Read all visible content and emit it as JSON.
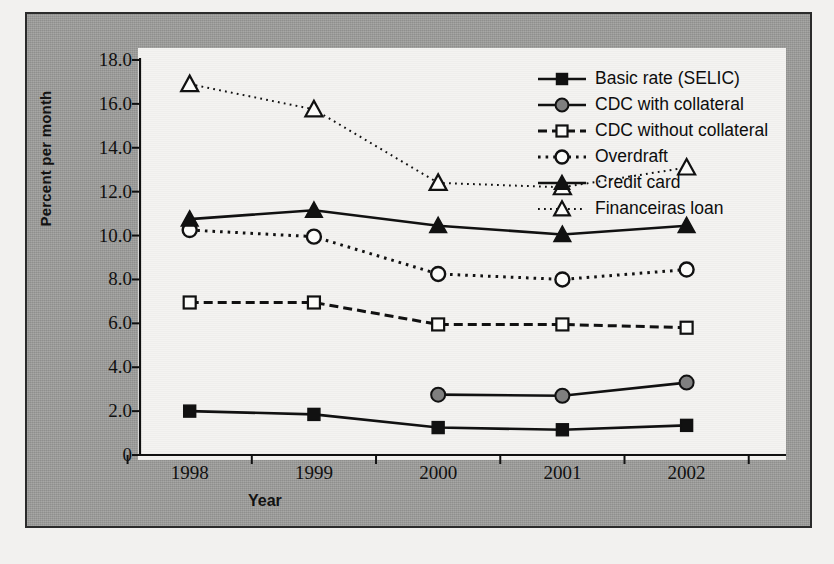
{
  "chart_data": {
    "type": "line",
    "title": "",
    "xlabel": "Year",
    "ylabel": "Percent per month",
    "categories": [
      "1998",
      "1999",
      "2000",
      "2001",
      "2002"
    ],
    "x": [
      1998,
      1999,
      2000,
      2001,
      2002
    ],
    "ylim": [
      0,
      18
    ],
    "xlim": [
      1997.6,
      2002.8
    ],
    "yticks": [
      "0",
      "2.0",
      "4.0",
      "6.0",
      "8.0",
      "10.0",
      "12.0",
      "14.0",
      "16.0",
      "18.0"
    ],
    "ytick_values": [
      0,
      2,
      4,
      6,
      8,
      10,
      12,
      14,
      16,
      18
    ],
    "grid": false,
    "legend_position": "upper right",
    "series": [
      {
        "name": "Basic rate (SELIC)",
        "marker": "filled-square",
        "line": "solid",
        "color": "#111111",
        "values": [
          2.0,
          1.85,
          1.25,
          1.15,
          1.35
        ]
      },
      {
        "name": "CDC with collateral",
        "marker": "filled-circle",
        "line": "solid",
        "color": "#111111",
        "marker_fill": "#7f7f7f",
        "values": [
          null,
          null,
          2.75,
          2.7,
          3.3
        ]
      },
      {
        "name": "CDC without collateral",
        "marker": "open-square",
        "line": "dashed",
        "color": "#111111",
        "values": [
          6.95,
          6.95,
          5.95,
          5.95,
          5.8
        ]
      },
      {
        "name": "Overdraft",
        "marker": "open-circle",
        "line": "dotted",
        "color": "#111111",
        "values": [
          10.25,
          9.95,
          8.25,
          8.0,
          8.45
        ]
      },
      {
        "name": "Credit card",
        "marker": "filled-triangle",
        "line": "solid",
        "color": "#111111",
        "values": [
          10.75,
          11.15,
          10.45,
          10.05,
          10.45
        ]
      },
      {
        "name": "Financeiras loan",
        "marker": "open-triangle",
        "line": "fine-dotted",
        "color": "#111111",
        "values": [
          16.9,
          15.75,
          12.4,
          12.2,
          13.1
        ]
      }
    ]
  }
}
